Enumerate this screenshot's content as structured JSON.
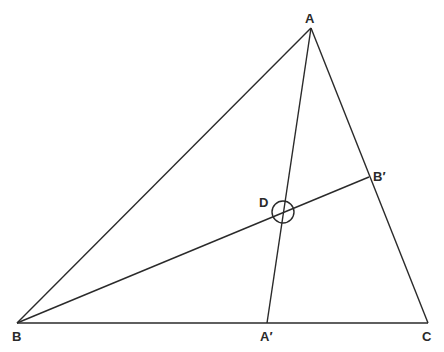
{
  "diagram": {
    "labels": {
      "A": "A",
      "B": "B",
      "C": "C",
      "A_prime": "A′",
      "B_prime": "B′",
      "D": "D"
    },
    "points": {
      "A": [
        311,
        28
      ],
      "B": [
        17,
        323
      ],
      "C": [
        428,
        323
      ],
      "A_prime": [
        267,
        323
      ],
      "B_prime": [
        369,
        177
      ],
      "D": [
        283,
        212
      ]
    },
    "segments": [
      [
        "A",
        "B"
      ],
      [
        "B",
        "C"
      ],
      [
        "A",
        "C"
      ],
      [
        "A",
        "A_prime"
      ],
      [
        "B",
        "B_prime"
      ]
    ],
    "circle": {
      "center": "D",
      "radius": 11
    },
    "color": "#2a2a2a"
  }
}
